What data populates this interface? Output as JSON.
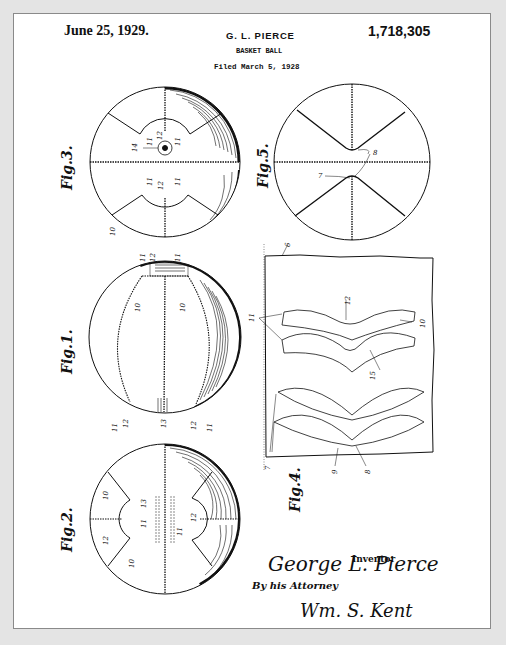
{
  "header": {
    "date": "June 25, 1929.",
    "inventor_name": "G. L. PIERCE",
    "patent_number": "1,718,305",
    "title": "BASKET BALL",
    "filed": "Filed March 5, 1928"
  },
  "figures": {
    "fig3": {
      "label": "Fig.3.",
      "refs": [
        "14",
        "11",
        "12",
        "11",
        "11",
        "12",
        "11",
        "10"
      ]
    },
    "fig5": {
      "label": "Fig.5.",
      "refs": [
        "8",
        "7"
      ]
    },
    "fig1": {
      "label": "Fig.1.",
      "refs": [
        "11",
        "12",
        "11",
        "10",
        "10",
        "11",
        "12",
        "13",
        "12",
        "11"
      ]
    },
    "fig4": {
      "label": "Fig.4.",
      "refs": [
        "6",
        "11",
        "12",
        "10",
        "15",
        "7",
        "9",
        "8"
      ]
    },
    "fig2": {
      "label": "Fig.2.",
      "refs": [
        "10",
        "13",
        "11",
        "12",
        "10",
        "12",
        "11"
      ]
    }
  },
  "signatures": {
    "inventor_signature": "George L. Pierce",
    "inventor_label": "Inventor",
    "attorney_label": "By his Attorney",
    "attorney_signature": "Wm. S. Kent"
  },
  "colors": {
    "background": "#e4e4e4",
    "paper": "#ffffff",
    "ink": "#111111",
    "border": "#8a8a8a"
  }
}
